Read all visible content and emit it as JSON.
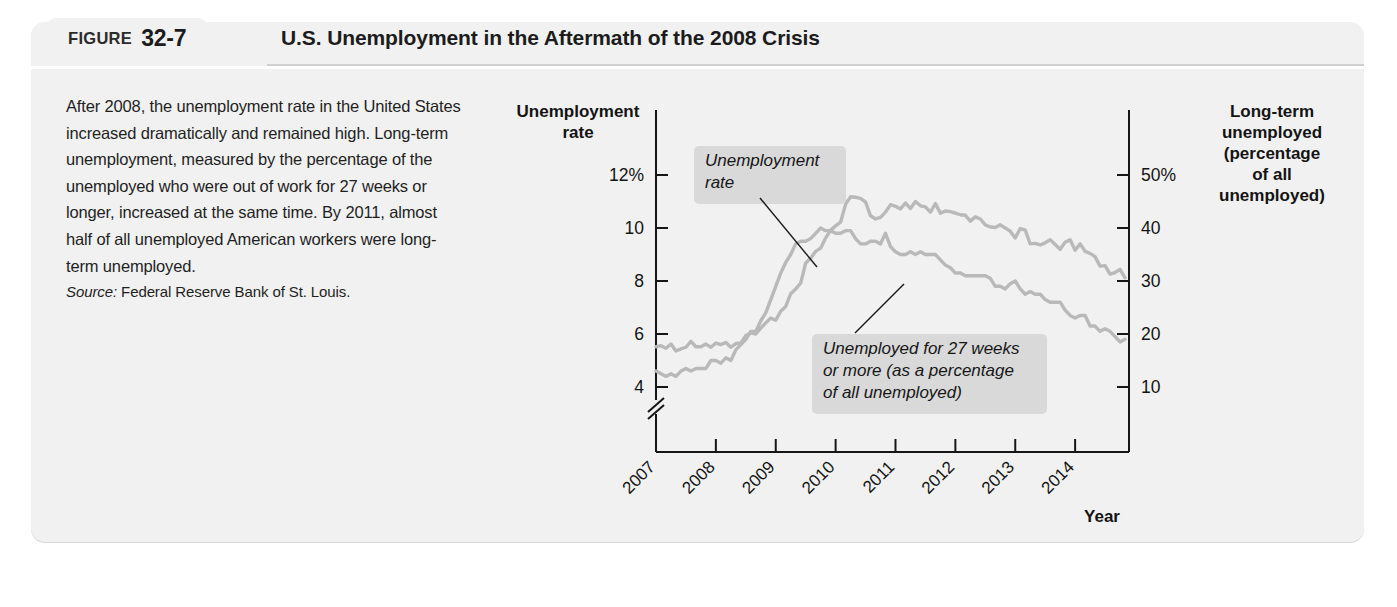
{
  "figure": {
    "tab_word": "FIGURE",
    "number": "32-7",
    "title": "U.S. Unemployment in the Aftermath of the 2008 Crisis"
  },
  "caption": {
    "body": "After 2008, the unemployment rate in the United States increased dramatically and remained high. Long-term unemployment, measured by the percentage of the unemployed who were out of work for 27 weeks or longer, increased at the same time. By 2011, almost half of all unemployed American workers were long-term unemployed.",
    "source_label": "Source:",
    "source_value": "Federal Reserve Bank of St. Louis."
  },
  "chart_data": {
    "type": "line",
    "title": "U.S. Unemployment in the Aftermath of the 2008 Crisis",
    "xlabel": "Year",
    "ylabel_left": "Unemployment rate",
    "ylabel_right": "Long-term unemployed (percentage of all unemployed)",
    "left_axis_title_lines": [
      "Unemployment",
      "rate"
    ],
    "right_axis_title_lines": [
      "Long-term",
      "unemployed",
      "(percentage",
      "of all",
      "unemployed)"
    ],
    "grid": false,
    "legend_position": "inline-annotations",
    "axis_break_left": true,
    "xlim": [
      2007.0,
      2014.9
    ],
    "x_tick_labels": [
      "2007",
      "2008",
      "2009",
      "2010",
      "2011",
      "2012",
      "2013",
      "2014"
    ],
    "x_ticks": [
      2007,
      2008,
      2009,
      2010,
      2011,
      2012,
      2013,
      2014
    ],
    "ylim_left": [
      3.0,
      13.0
    ],
    "y_ticks_left": [
      4,
      6,
      8,
      10,
      12
    ],
    "y_tick_labels_left": [
      "4",
      "6",
      "8",
      "10",
      "12%"
    ],
    "ylim_right": [
      5.0,
      55.0
    ],
    "y_ticks_right": [
      10,
      20,
      30,
      40,
      50
    ],
    "y_tick_labels_right": [
      "10",
      "20",
      "30",
      "40",
      "50%"
    ],
    "annotations": [
      {
        "name": "unemployment-rate-callout",
        "lines": [
          "Unemployment",
          "rate"
        ],
        "points_to_series": "Unemployment rate"
      },
      {
        "name": "long-term-unemployed-callout",
        "lines": [
          "Unemployed for 27 weeks",
          "or more (as a percentage",
          "of all unemployed)"
        ],
        "points_to_series": "Unemployed for 27 weeks or more"
      }
    ],
    "series": [
      {
        "name": "Unemployment rate",
        "axis": "left",
        "units": "percent",
        "color": "#b9b9b9",
        "x": [
          2007.0,
          2007.083,
          2007.167,
          2007.25,
          2007.333,
          2007.417,
          2007.5,
          2007.583,
          2007.667,
          2007.75,
          2007.833,
          2007.917,
          2008.0,
          2008.083,
          2008.167,
          2008.25,
          2008.333,
          2008.417,
          2008.5,
          2008.583,
          2008.667,
          2008.75,
          2008.833,
          2008.917,
          2009.0,
          2009.083,
          2009.167,
          2009.25,
          2009.333,
          2009.417,
          2009.5,
          2009.583,
          2009.667,
          2009.75,
          2009.833,
          2009.917,
          2010.0,
          2010.083,
          2010.167,
          2010.25,
          2010.333,
          2010.417,
          2010.5,
          2010.583,
          2010.667,
          2010.75,
          2010.833,
          2010.917,
          2011.0,
          2011.083,
          2011.167,
          2011.25,
          2011.333,
          2011.417,
          2011.5,
          2011.583,
          2011.667,
          2011.75,
          2011.833,
          2011.917,
          2012.0,
          2012.083,
          2012.167,
          2012.25,
          2012.333,
          2012.417,
          2012.5,
          2012.583,
          2012.667,
          2012.75,
          2012.833,
          2012.917,
          2013.0,
          2013.083,
          2013.167,
          2013.25,
          2013.333,
          2013.417,
          2013.5,
          2013.583,
          2013.667,
          2013.75,
          2013.833,
          2013.917,
          2014.0,
          2014.083,
          2014.167,
          2014.25,
          2014.333,
          2014.417,
          2014.5,
          2014.583,
          2014.667,
          2014.75,
          2014.833
        ],
        "values": [
          4.6,
          4.5,
          4.4,
          4.5,
          4.4,
          4.6,
          4.7,
          4.6,
          4.7,
          4.7,
          4.7,
          5.0,
          5.0,
          4.9,
          5.1,
          5.0,
          5.4,
          5.6,
          5.8,
          6.1,
          6.1,
          6.5,
          6.8,
          7.3,
          7.8,
          8.3,
          8.7,
          9.0,
          9.4,
          9.5,
          9.5,
          9.6,
          9.8,
          10.0,
          9.9,
          9.9,
          9.8,
          9.8,
          9.9,
          9.9,
          9.6,
          9.4,
          9.4,
          9.5,
          9.5,
          9.4,
          9.8,
          9.3,
          9.1,
          9.0,
          9.0,
          9.1,
          9.0,
          9.1,
          9.0,
          9.0,
          9.0,
          8.8,
          8.6,
          8.5,
          8.3,
          8.3,
          8.2,
          8.2,
          8.2,
          8.2,
          8.2,
          8.1,
          7.8,
          7.8,
          7.7,
          7.9,
          8.0,
          7.7,
          7.5,
          7.6,
          7.5,
          7.5,
          7.3,
          7.2,
          7.2,
          7.2,
          6.9,
          6.7,
          6.6,
          6.7,
          6.7,
          6.3,
          6.3,
          6.1,
          6.2,
          6.1,
          5.9,
          5.7,
          5.8
        ]
      },
      {
        "name": "Unemployed for 27 weeks or more",
        "axis": "right",
        "units": "percent of all unemployed",
        "color": "#b9b9b9",
        "x": [
          2007.0,
          2007.083,
          2007.167,
          2007.25,
          2007.333,
          2007.417,
          2007.5,
          2007.583,
          2007.667,
          2007.75,
          2007.833,
          2007.917,
          2008.0,
          2008.083,
          2008.167,
          2008.25,
          2008.333,
          2008.417,
          2008.5,
          2008.583,
          2008.667,
          2008.75,
          2008.833,
          2008.917,
          2009.0,
          2009.083,
          2009.167,
          2009.25,
          2009.333,
          2009.417,
          2009.5,
          2009.583,
          2009.667,
          2009.75,
          2009.833,
          2009.917,
          2010.0,
          2010.083,
          2010.167,
          2010.25,
          2010.333,
          2010.417,
          2010.5,
          2010.583,
          2010.667,
          2010.75,
          2010.833,
          2010.917,
          2011.0,
          2011.083,
          2011.167,
          2011.25,
          2011.333,
          2011.417,
          2011.5,
          2011.583,
          2011.667,
          2011.75,
          2011.833,
          2011.917,
          2012.0,
          2012.083,
          2012.167,
          2012.25,
          2012.333,
          2012.417,
          2012.5,
          2012.583,
          2012.667,
          2012.75,
          2012.833,
          2012.917,
          2013.0,
          2013.083,
          2013.167,
          2013.25,
          2013.333,
          2013.417,
          2013.5,
          2013.583,
          2013.667,
          2013.75,
          2013.833,
          2013.917,
          2014.0,
          2014.083,
          2014.167,
          2014.25,
          2014.333,
          2014.417,
          2014.5,
          2014.583,
          2014.667,
          2014.75,
          2014.833
        ],
        "values": [
          17.6,
          17.8,
          17.3,
          18.1,
          16.8,
          17.2,
          17.5,
          18.6,
          17.6,
          17.6,
          18.1,
          17.5,
          18.3,
          18.0,
          18.4,
          17.5,
          18.2,
          18.3,
          19.7,
          20.2,
          20.0,
          21.1,
          22.1,
          23.0,
          22.6,
          24.3,
          25.2,
          27.6,
          28.5,
          29.6,
          33.4,
          34.3,
          35.6,
          36.2,
          38.1,
          39.6,
          40.4,
          41.1,
          44.5,
          45.9,
          45.8,
          45.6,
          44.9,
          42.3,
          41.7,
          42.0,
          43.0,
          44.4,
          44.1,
          43.6,
          44.7,
          43.7,
          45.0,
          44.2,
          44.0,
          43.0,
          44.6,
          42.8,
          43.2,
          43.1,
          42.8,
          42.5,
          42.4,
          41.3,
          42.1,
          41.7,
          40.6,
          40.2,
          40.1,
          40.6,
          40.0,
          39.4,
          38.1,
          39.9,
          39.6,
          37.0,
          37.1,
          36.8,
          37.2,
          37.8,
          36.9,
          36.0,
          37.3,
          37.8,
          35.8,
          37.0,
          35.6,
          35.2,
          34.6,
          32.8,
          32.9,
          31.3,
          31.6,
          32.2,
          30.6
        ]
      }
    ]
  }
}
